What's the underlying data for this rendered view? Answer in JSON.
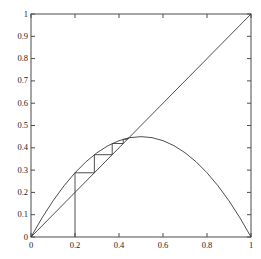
{
  "figure": {
    "kind": "cobweb-plot",
    "background_color": "#ffffff",
    "line_color": "#3a3a3a",
    "axis_color": "#4d4d4d"
  },
  "axes": {
    "x_ticks": [
      "0",
      "0.2",
      "0.4",
      "0.6",
      "0.8",
      "1"
    ],
    "x_tick_values": [
      0,
      0.2,
      0.4,
      0.6,
      0.8,
      1
    ],
    "y_ticks": [
      "0",
      "0.1",
      "0.2",
      "0.3",
      "0.4",
      "0.5",
      "0.6",
      "0.7",
      "0.8",
      "0.9",
      "1"
    ],
    "y_tick_values": [
      0,
      0.1,
      0.2,
      0.3,
      0.4,
      0.5,
      0.6,
      0.7,
      0.8,
      0.9,
      1
    ],
    "xlim": [
      0,
      1
    ],
    "ylim": [
      0,
      1
    ],
    "box": true,
    "grid": false,
    "ticks_direction": "in"
  },
  "chart_data": {
    "type": "line",
    "title": "",
    "xlabel": "",
    "ylabel": "",
    "xlim": [
      0,
      1
    ],
    "ylim": [
      0,
      1
    ],
    "grid": false,
    "legend": "none",
    "parameters": {
      "map": "logistic",
      "r": 1.8,
      "x0": 0.2,
      "fixed_point": 0.4444,
      "peak_value": 0.45,
      "peak_x": 0.5,
      "iterations": 5
    },
    "series": [
      {
        "name": "logistic-map-curve",
        "type": "line",
        "comment": "f(x) = 1.8 x (1 - x)",
        "x": [
          0,
          0.05,
          0.1,
          0.15,
          0.2,
          0.25,
          0.3,
          0.35,
          0.4,
          0.45,
          0.5,
          0.55,
          0.6,
          0.65,
          0.7,
          0.75,
          0.8,
          0.85,
          0.9,
          0.95,
          1
        ],
        "y": [
          0,
          0.0855,
          0.162,
          0.2295,
          0.288,
          0.3375,
          0.378,
          0.4095,
          0.432,
          0.4455,
          0.45,
          0.4455,
          0.432,
          0.4095,
          0.378,
          0.3375,
          0.288,
          0.2295,
          0.162,
          0.0855,
          0
        ]
      },
      {
        "name": "identity-line",
        "type": "line",
        "comment": "y = x diagonal",
        "x": [
          0,
          1
        ],
        "y": [
          0,
          1
        ]
      },
      {
        "name": "cobweb-path",
        "type": "line",
        "comment": "staircase from x0=0.2 toward fixed point 0.4444",
        "x": [
          0.2,
          0.2,
          0.288,
          0.288,
          0.3691,
          0.3691,
          0.4192,
          0.4192,
          0.4385,
          0.4385,
          0.443,
          0.443,
          0.4441
        ],
        "y": [
          0,
          0.288,
          0.288,
          0.3691,
          0.3691,
          0.4192,
          0.4192,
          0.4385,
          0.4385,
          0.443,
          0.443,
          0.4441,
          0.4441
        ]
      }
    ],
    "annotations": []
  }
}
